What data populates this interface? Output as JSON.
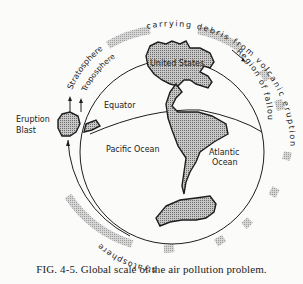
{
  "figure": {
    "caption": "FIG. 4-5. Global scale of the air pollution problem.",
    "labels": {
      "eruption_blast_line1": "Eruption",
      "eruption_blast_line2": "Blast",
      "equator": "Equator",
      "pacific_ocean": "Pacific Ocean",
      "atlantic_ocean_line1": "Atlantic",
      "atlantic_ocean_line2": "Ocean",
      "united_states": "United States",
      "stratosphere_up": "Stratosphere",
      "troposphere": "Troposphere",
      "region_of_fallout": "Region of fallout",
      "outer_band_text": "carrying debris from volcanic eruption or atomic blast",
      "lower_left_stratosphere": "stratosphere"
    },
    "colors": {
      "land_fill": "#9a9a9a",
      "band_fill": "#bdbdbd",
      "line": "#1e1e1e",
      "background": "#fbfbfa"
    }
  }
}
